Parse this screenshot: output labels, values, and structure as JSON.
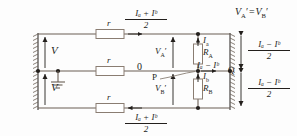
{
  "figure": {
    "type": "circuit-diagram",
    "background_color": "#fdfdfd",
    "line_color": "#231f1c",
    "wire_color": "#6b5f55"
  },
  "annotations": {
    "equality_top_right": "V ′ = V ′",
    "equality_top_right_parts": {
      "left": "V",
      "left_sub": "A",
      "prime": "′",
      "eq": "=",
      "right": "V",
      "right_sub": "B"
    },
    "supply_upper": "V",
    "supply_lower": "V",
    "neutral_current": "0",
    "point_p": "P",
    "point_q": "Q",
    "resistor_series_1": "r",
    "resistor_series_2": "r",
    "resistor_series_3": "r",
    "load_a": "R",
    "load_a_sub": "A",
    "load_b": "R",
    "load_b_sub": "B",
    "current_a": "I",
    "current_a_sub": "a",
    "current_b": "I",
    "current_b_sub": "b",
    "voltage_a_prime": "V",
    "voltage_a_prime_sub": "A",
    "voltage_b_prime": "V",
    "voltage_b_prime_sub": "B",
    "prime_mark": "′",
    "minus": "−",
    "plus": "+"
  },
  "fractions": {
    "top_outer_current": {
      "numerator": "Iₐ + Iᵇ",
      "denominator": "2"
    },
    "bottom_outer_current": {
      "numerator": "Iₐ + Iᵇ",
      "denominator": "2"
    },
    "right_upper_drop": {
      "numerator": "Iₐ − Iᵇ",
      "denominator": "2"
    },
    "right_lower_drop": {
      "numerator": "Iₐ − Iᵇ",
      "denominator": "2"
    }
  },
  "neutral_branch_current": {
    "expr": "Iₐ − Iᵇ"
  },
  "icons": {
    "ground": "ground-symbol",
    "arrow_right": "arrow-right",
    "arrow_left": "arrow-left",
    "arrow_up": "arrow-up",
    "arrow_double": "arrow-double-vertical",
    "hatch_left": "hatched-bus-left",
    "hatch_right": "hatched-bus-right"
  }
}
